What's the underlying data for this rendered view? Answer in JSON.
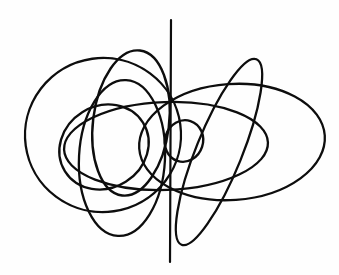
{
  "figure": {
    "title": "Abstract overlapping-ellipse line drawing",
    "background_color": "#fefefe",
    "stroke_color": "#0d0d0d",
    "canvas": {
      "width": 339,
      "height": 275
    },
    "element_count": 8
  },
  "chart_data": {
    "type": "scatter",
    "title": "Abstract overlapping-ellipse line drawing",
    "xlabel": "",
    "ylabel": "",
    "xlim": [
      0,
      339
    ],
    "ylim": [
      0,
      275
    ],
    "grid": false,
    "legend": "none",
    "shapes": [
      {
        "name": "large-left-circle",
        "kind": "ellipse",
        "cx": 103,
        "cy": 135,
        "rx": 78,
        "ry": 77,
        "rotation": -8,
        "stroke_width": 2.3
      },
      {
        "name": "large-right-ellipse",
        "kind": "ellipse",
        "cx": 232,
        "cy": 142,
        "rx": 93,
        "ry": 58,
        "rotation": -4,
        "stroke_width": 2.3
      },
      {
        "name": "wide-center-ellipse",
        "kind": "ellipse",
        "cx": 166,
        "cy": 146,
        "rx": 102,
        "ry": 44,
        "rotation": -2,
        "stroke_width": 2.3
      },
      {
        "name": "tall-upper-left-ellipse",
        "kind": "ellipse",
        "cx": 131,
        "cy": 123,
        "rx": 38,
        "ry": 73,
        "rotation": 7,
        "stroke_width": 2.4
      },
      {
        "name": "tilted-left-inner-ellipse",
        "kind": "ellipse",
        "cx": 104,
        "cy": 147,
        "rx": 46,
        "ry": 41,
        "rotation": -32,
        "stroke_width": 2.3
      },
      {
        "name": "tall-lower-left-ellipse",
        "kind": "ellipse",
        "cx": 122,
        "cy": 158,
        "rx": 43,
        "ry": 78,
        "rotation": 3,
        "stroke_width": 2.3
      },
      {
        "name": "narrow-diagonal-right-ellipse",
        "kind": "ellipse",
        "cx": 219,
        "cy": 152,
        "rx": 23,
        "ry": 100,
        "rotation": 22,
        "stroke_width": 2.3
      },
      {
        "name": "small-center-loop",
        "kind": "ellipse",
        "cx": 184,
        "cy": 141,
        "rx": 19,
        "ry": 21,
        "rotation": 18,
        "stroke_width": 2.4
      },
      {
        "name": "vertical-axis-line",
        "kind": "line",
        "x1": 171,
        "y1": 20,
        "x2": 170,
        "y2": 262,
        "stroke_width": 2.2
      }
    ]
  }
}
